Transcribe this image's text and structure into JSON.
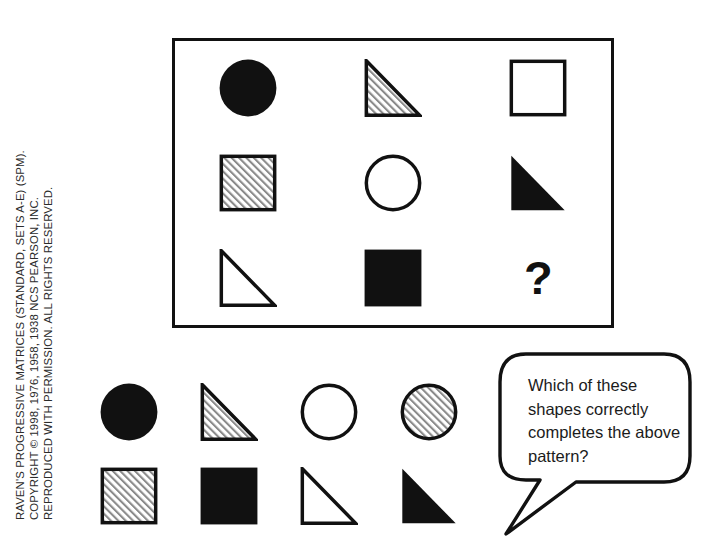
{
  "copyright": {
    "line1": "RAVEN'S PROGRESSIVE MATRICES (STANDARD, SETS A-E) (SPM).",
    "line2": "COPYRIGHT © 1998, 1976, 1958, 1938 NCS PEARSON, INC.",
    "line3": "REPRODUCED WITH PERMISSION. ALL RIGHTS RESERVED."
  },
  "matrix": {
    "missing_marker": "?",
    "cells": [
      {
        "row": 1,
        "col": 1,
        "shape": "circle",
        "fill": "solid",
        "label": "solid-circle"
      },
      {
        "row": 1,
        "col": 2,
        "shape": "triangle",
        "fill": "hatched",
        "label": "hatched-triangle"
      },
      {
        "row": 1,
        "col": 3,
        "shape": "square",
        "fill": "outline",
        "label": "outline-square"
      },
      {
        "row": 2,
        "col": 1,
        "shape": "square",
        "fill": "hatched",
        "label": "hatched-square"
      },
      {
        "row": 2,
        "col": 2,
        "shape": "circle",
        "fill": "outline",
        "label": "outline-circle"
      },
      {
        "row": 2,
        "col": 3,
        "shape": "triangle",
        "fill": "solid",
        "label": "solid-triangle"
      },
      {
        "row": 3,
        "col": 1,
        "shape": "triangle",
        "fill": "outline",
        "label": "outline-triangle"
      },
      {
        "row": 3,
        "col": 2,
        "shape": "square",
        "fill": "solid",
        "label": "solid-square"
      },
      {
        "row": 3,
        "col": 3,
        "shape": "missing",
        "fill": "none",
        "label": "missing-cell"
      }
    ]
  },
  "options": [
    {
      "index": 1,
      "shape": "circle",
      "fill": "solid",
      "label": "solid-circle"
    },
    {
      "index": 2,
      "shape": "triangle",
      "fill": "hatched",
      "label": "hatched-triangle"
    },
    {
      "index": 3,
      "shape": "circle",
      "fill": "outline",
      "label": "outline-circle"
    },
    {
      "index": 4,
      "shape": "circle",
      "fill": "hatched",
      "label": "hatched-circle"
    },
    {
      "index": 5,
      "shape": "square",
      "fill": "hatched",
      "label": "hatched-square"
    },
    {
      "index": 6,
      "shape": "square",
      "fill": "solid",
      "label": "solid-square"
    },
    {
      "index": 7,
      "shape": "triangle",
      "fill": "outline",
      "label": "outline-triangle"
    },
    {
      "index": 8,
      "shape": "triangle",
      "fill": "solid",
      "label": "solid-triangle"
    }
  ],
  "speech_bubble": {
    "text": "Which of these shapes correctly completes the above pattern?"
  },
  "colors": {
    "ink": "#111111",
    "background": "#ffffff",
    "hatch": "#8a8a8a"
  }
}
